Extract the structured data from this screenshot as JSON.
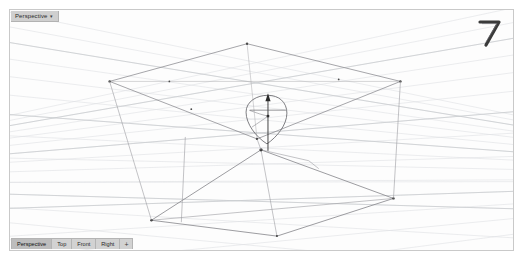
{
  "app": {
    "name": "3D Modeling Viewport",
    "background_color": "#ffffff",
    "viewport_background": "#fdfdfd",
    "border_color": "#c9c9c9"
  },
  "viewport": {
    "title_tab": {
      "label": "Perspective",
      "caret": "▾"
    },
    "axis_gizmo": {
      "icon_name": "camera-axis-gizmo",
      "color": "#3a3a3a"
    }
  },
  "tab_strip": {
    "tabs": [
      {
        "label": "Perspective",
        "active": true
      },
      {
        "label": "Top",
        "active": false
      },
      {
        "label": "Front",
        "active": false
      },
      {
        "label": "Right",
        "active": false
      }
    ],
    "add_tab_label": "+"
  },
  "scene": {
    "grid": {
      "line_color": "#d8dadd",
      "major_line_color": "#c3c6ca",
      "description": "perspective ground grid"
    },
    "wireframe": {
      "line_color": "#8e8e92",
      "point_color": "#3a3a3a",
      "upper_quad_label": "upper surface wireframe",
      "lower_quad_label": "lower surface wireframe"
    },
    "gumball": {
      "label": "move manipulator",
      "arrow_color": "#2d2d2d",
      "shape_color": "#5a5a5e"
    }
  }
}
